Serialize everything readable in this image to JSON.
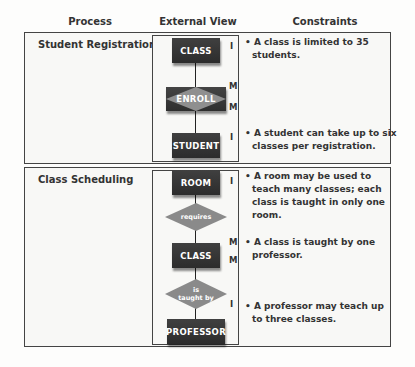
{
  "headers": {
    "process": "Process",
    "external_view": "External View",
    "constraints": "Constraints"
  },
  "sections": [
    {
      "process": "Student Registration",
      "diagram": {
        "entity_top": "CLASS",
        "associative": "ENROLL",
        "entity_bottom": "STUDENT",
        "cardinalities": [
          "I",
          "M",
          "M",
          "I"
        ]
      },
      "constraints": [
        "• A class is limited to 35 students.",
        "• A student can take up to six classes per registration."
      ]
    },
    {
      "process": "Class Scheduling",
      "diagram": {
        "entity_1": "ROOM",
        "relationship_1": "requires",
        "entity_2": "CLASS",
        "relationship_2_line1": "is",
        "relationship_2_line2": "taught by",
        "entity_3": "PROFESSOR",
        "cardinalities": [
          "I",
          "M",
          "M",
          "I"
        ]
      },
      "constraints": [
        "• A room may be used to teach many classes; each class is taught in only one room.",
        "• A class is taught by one professor.",
        "• A professor may teach up to three classes."
      ]
    }
  ],
  "colors": {
    "entity_fill": "#383838",
    "relationship_fill": "#8a8a8a",
    "border": "#444444"
  }
}
